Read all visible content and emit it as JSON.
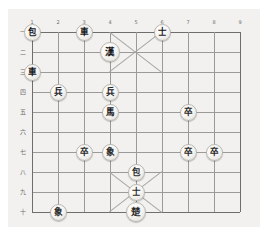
{
  "app": {
    "title": "Janggi Board",
    "background_color": "#ffffff",
    "board_color": "#f2f1ef",
    "line_color": "#9a9a98",
    "edge_color": "#6e6e6c"
  },
  "board": {
    "files": [
      "1",
      "2",
      "3",
      "4",
      "5",
      "6",
      "7",
      "8",
      "9"
    ],
    "ranks": [
      "一",
      "二",
      "三",
      "四",
      "五",
      "六",
      "七",
      "八",
      "九",
      "十"
    ],
    "file_count": 9,
    "rank_count": 10
  },
  "pieces": [
    {
      "glyph": "包",
      "name": "cannon",
      "side": "blue",
      "file": 1,
      "rank": 1,
      "type": "piece"
    },
    {
      "glyph": "車",
      "name": "chariot",
      "side": "blue",
      "file": 3,
      "rank": 1,
      "type": "piece"
    },
    {
      "glyph": "士",
      "name": "advisor",
      "side": "blue",
      "file": 6,
      "rank": 1,
      "type": "piece"
    },
    {
      "glyph": "漢",
      "name": "han-general",
      "side": "blue",
      "file": 4,
      "rank": 2,
      "type": "general"
    },
    {
      "glyph": "車",
      "name": "chariot",
      "side": "blue",
      "file": 1,
      "rank": 3,
      "type": "piece"
    },
    {
      "glyph": "兵",
      "name": "soldier",
      "side": "blue",
      "file": 2,
      "rank": 4,
      "type": "piece"
    },
    {
      "glyph": "兵",
      "name": "soldier",
      "side": "blue",
      "file": 4,
      "rank": 4,
      "type": "piece"
    },
    {
      "glyph": "馬",
      "name": "horse",
      "side": "blue",
      "file": 4,
      "rank": 5,
      "type": "piece"
    },
    {
      "glyph": "卒",
      "name": "soldier",
      "side": "red",
      "file": 7,
      "rank": 5,
      "type": "piece"
    },
    {
      "glyph": "卒",
      "name": "soldier",
      "side": "red",
      "file": 3,
      "rank": 7,
      "type": "piece"
    },
    {
      "glyph": "象",
      "name": "elephant",
      "side": "red",
      "file": 4,
      "rank": 7,
      "type": "piece"
    },
    {
      "glyph": "卒",
      "name": "soldier",
      "side": "red",
      "file": 7,
      "rank": 7,
      "type": "piece"
    },
    {
      "glyph": "卒",
      "name": "soldier",
      "side": "red",
      "file": 8,
      "rank": 7,
      "type": "piece"
    },
    {
      "glyph": "包",
      "name": "cannon",
      "side": "red",
      "file": 5,
      "rank": 8,
      "type": "piece"
    },
    {
      "glyph": "士",
      "name": "advisor",
      "side": "red",
      "file": 5,
      "rank": 9,
      "type": "piece"
    },
    {
      "glyph": "楚",
      "name": "chu-general",
      "side": "red",
      "file": 5,
      "rank": 10,
      "type": "general"
    },
    {
      "glyph": "象",
      "name": "elephant",
      "side": "red",
      "file": 2,
      "rank": 10,
      "type": "piece"
    }
  ]
}
